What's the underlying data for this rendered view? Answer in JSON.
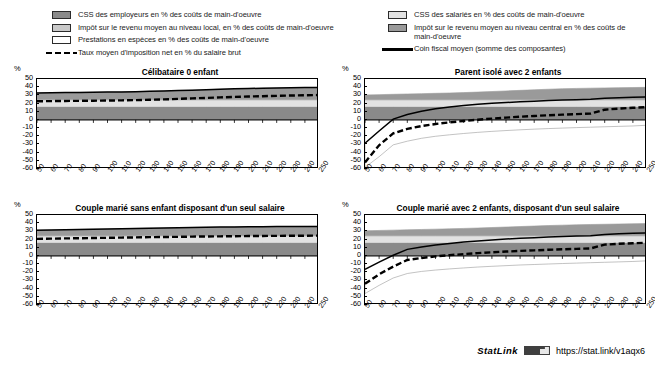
{
  "legend": {
    "left_items": [
      {
        "swatch": "employer-swatch",
        "label": "CSS des employeurs en % des coûts de main-d'oeuvre"
      },
      {
        "swatch": "local-tax-swatch",
        "label": "Impôt sur le revenu moyen au niveau local, en % des coûts de main-d'oeuvre"
      },
      {
        "swatch": "benefits-swatch",
        "label": "Prestations en espèces en % des coûts de main-d'oeuvre"
      },
      {
        "swatch": "dashed-line-sample",
        "label": "Taux moyen d'imposition net en % du salaire brut"
      }
    ],
    "right_items": [
      {
        "swatch": "employee-swatch",
        "label": "CSS des salariés en % des coûts de main-d'oeuvre"
      },
      {
        "swatch": "central-tax-swatch",
        "label": "Impôt sur le revenu moyen au niveau central en % des coûts de main-d'oeuvre"
      },
      {
        "swatch": "solid-line-sample",
        "label": "Coin fiscal moyen (somme des composantes)"
      }
    ]
  },
  "colors": {
    "employer": "#8a8a8a",
    "local_tax": "#c9c9c9",
    "benefits": "#ffffff",
    "employee": "#e2e2e2",
    "central_tax": "#9a9a9a",
    "net_rate_line": "#000000",
    "wedge_line": "#000000",
    "axis": "#000000"
  },
  "statlink": {
    "word": "StatLink",
    "badge": "statlink-badge-icon",
    "url": "https://stat.link/v1aqx6"
  },
  "axes": {
    "unit": "%",
    "y_ticks": [
      50,
      40,
      30,
      20,
      10,
      0,
      -10,
      -20,
      -30,
      -40,
      -50,
      -60
    ],
    "ylim": [
      -60,
      50
    ],
    "x_ticks": [
      50,
      60,
      70,
      80,
      90,
      100,
      110,
      120,
      130,
      140,
      150,
      160,
      170,
      180,
      190,
      200,
      210,
      220,
      230,
      240,
      250
    ],
    "xlim": [
      50,
      250
    ]
  },
  "chart_data": [
    {
      "id": "celibataire-0-enfant",
      "type": "area",
      "title": "Célibataire 0 enfant",
      "xlabel": "",
      "ylabel": "%",
      "ylim": [
        -60,
        50
      ],
      "xlim": [
        50,
        250
      ],
      "grid": false,
      "legend_position": "top",
      "x": [
        50,
        60,
        70,
        80,
        90,
        100,
        110,
        120,
        130,
        140,
        150,
        160,
        170,
        180,
        190,
        200,
        210,
        220,
        230,
        240,
        250
      ],
      "series": [
        {
          "name": "CSS des employeurs en % des coûts de main-d'oeuvre",
          "stack": true,
          "color": "#8a8a8a",
          "values": [
            16.3,
            16.3,
            16.3,
            16.3,
            16.3,
            16.3,
            16.3,
            16.3,
            16.3,
            16.3,
            16.3,
            16.3,
            16.3,
            16.3,
            16.3,
            16.3,
            16.3,
            16.3,
            16.3,
            16.3,
            16.3
          ]
        },
        {
          "name": "CSS des salariés en % des coûts de main-d'oeuvre",
          "stack": true,
          "color": "#e2e2e2",
          "values": [
            8.2,
            8.2,
            8.2,
            8.2,
            8.2,
            8.2,
            8.2,
            8.2,
            8.2,
            8.2,
            8.2,
            8.2,
            8.2,
            8.2,
            8.2,
            8.2,
            8.2,
            8.2,
            8.2,
            8.2,
            8.2
          ]
        },
        {
          "name": "Impôt sur le revenu moyen au niveau central en % des coûts de main-d'oeuvre",
          "stack": true,
          "color": "#9a9a9a",
          "values": [
            8.5,
            8.7,
            8.9,
            9.1,
            9.3,
            9.5,
            9.7,
            10.0,
            10.4,
            10.9,
            11.4,
            11.9,
            12.4,
            13.0,
            13.5,
            13.9,
            14.2,
            14.5,
            14.8,
            15.0,
            15.2
          ]
        },
        {
          "name": "Impôt sur le revenu moyen au niveau local, en % des coûts de main-d'oeuvre",
          "stack": true,
          "color": "#c9c9c9",
          "values": [
            0,
            0,
            0,
            0,
            0,
            0,
            0,
            0,
            0,
            0,
            0,
            0,
            0,
            0,
            0,
            0,
            0,
            0,
            0,
            0,
            0
          ]
        },
        {
          "name": "Prestations en espèces en % des coûts de main-d'oeuvre",
          "stack": true,
          "color": "#ffffff",
          "values": [
            0,
            0,
            0,
            0,
            0,
            0,
            0,
            0,
            0,
            0,
            0,
            0,
            0,
            0,
            0,
            0,
            0,
            0,
            0,
            0,
            0
          ]
        }
      ],
      "lines": [
        {
          "name": "Coin fiscal moyen (somme des composantes)",
          "style": "solid",
          "color": "#000000",
          "values": [
            33.0,
            33.2,
            33.4,
            33.6,
            33.8,
            34.0,
            34.2,
            34.5,
            34.9,
            35.4,
            35.9,
            36.4,
            36.9,
            37.5,
            38.0,
            38.4,
            38.7,
            39.0,
            39.3,
            39.5,
            39.7
          ]
        },
        {
          "name": "Taux moyen d'imposition net en % du salaire brut",
          "style": "dashed",
          "color": "#000000",
          "values": [
            22.8,
            23.0,
            23.2,
            23.3,
            23.5,
            23.7,
            23.9,
            24.2,
            24.6,
            25.1,
            25.7,
            26.3,
            26.9,
            27.5,
            28.1,
            28.6,
            29.0,
            29.4,
            29.8,
            30.1,
            30.4
          ]
        }
      ]
    },
    {
      "id": "parent-isole-2-enfants",
      "type": "area",
      "title": "Parent isolé avec 2 enfants",
      "xlabel": "",
      "ylabel": "%",
      "ylim": [
        -60,
        50
      ],
      "xlim": [
        50,
        250
      ],
      "grid": false,
      "legend_position": "top",
      "x": [
        50,
        60,
        70,
        80,
        90,
        100,
        110,
        120,
        130,
        140,
        150,
        160,
        170,
        180,
        190,
        200,
        210,
        220,
        230,
        240,
        250
      ],
      "series": [
        {
          "name": "CSS des employeurs en % des coûts de main-d'oeuvre",
          "stack": true,
          "color": "#8a8a8a",
          "values": [
            16.3,
            16.3,
            16.3,
            16.3,
            16.3,
            16.3,
            16.3,
            16.3,
            16.3,
            16.3,
            16.3,
            16.3,
            16.3,
            16.3,
            16.3,
            16.3,
            16.3,
            16.3,
            16.3,
            16.3,
            16.3
          ]
        },
        {
          "name": "CSS des salariés en % des coûts de main-d'oeuvre",
          "stack": true,
          "color": "#e2e2e2",
          "values": [
            8.2,
            8.2,
            8.2,
            8.2,
            8.2,
            8.2,
            8.2,
            8.2,
            8.2,
            8.2,
            8.2,
            8.2,
            8.2,
            8.2,
            8.2,
            8.2,
            8.2,
            8.2,
            8.2,
            8.2,
            8.2
          ]
        },
        {
          "name": "Impôt sur le revenu moyen au niveau central en % des coûts de main-d'oeuvre",
          "stack": true,
          "color": "#9a9a9a",
          "values": [
            6.0,
            6.4,
            6.8,
            7.2,
            7.6,
            8.0,
            8.4,
            8.9,
            9.5,
            10.2,
            10.9,
            11.6,
            12.3,
            13.0,
            13.6,
            14.0,
            14.3,
            14.6,
            14.9,
            15.1,
            15.3
          ]
        },
        {
          "name": "Impôt sur le revenu moyen au niveau local, en % des coûts de main-d'oeuvre",
          "stack": true,
          "color": "#c9c9c9",
          "values": [
            0,
            0,
            0,
            0,
            0,
            0,
            0,
            0,
            0,
            0,
            0,
            0,
            0,
            0,
            0,
            0,
            0,
            0,
            0,
            0,
            0
          ]
        },
        {
          "name": "Prestations en espèces en % des coûts de main-d'oeuvre",
          "stack": true,
          "color": "#ffffff",
          "values": [
            -58.0,
            -45.0,
            -30.5,
            -26.0,
            -22.5,
            -20.0,
            -18.2,
            -16.6,
            -15.2,
            -14.0,
            -13.0,
            -12.1,
            -11.3,
            -10.6,
            -10.0,
            -9.4,
            -8.9,
            -8.4,
            -7.9,
            -7.4,
            -6.5
          ]
        }
      ],
      "lines": [
        {
          "name": "Coin fiscal moyen (somme des composantes)",
          "style": "solid",
          "color": "#000000",
          "values": [
            -28.5,
            -13.5,
            1.0,
            6.5,
            10.5,
            13.5,
            15.8,
            17.6,
            19.1,
            20.3,
            21.3,
            22.2,
            22.9,
            23.6,
            24.2,
            24.7,
            25.2,
            26.5,
            27.1,
            27.7,
            28.2
          ]
        },
        {
          "name": "Taux moyen d'imposition net en % du salaire brut",
          "style": "dashed",
          "color": "#000000",
          "values": [
            -52.0,
            -31.0,
            -16.5,
            -11.0,
            -7.5,
            -5.0,
            -3.0,
            -1.3,
            0.2,
            1.6,
            2.8,
            3.9,
            4.8,
            5.7,
            6.4,
            7.1,
            7.7,
            12.5,
            13.8,
            14.8,
            15.6
          ]
        }
      ]
    },
    {
      "id": "couple-marie-sans-enfant",
      "type": "area",
      "title": "Couple marié sans enfant disposant d'un seul salaire",
      "xlabel": "",
      "ylabel": "%",
      "ylim": [
        -60,
        50
      ],
      "xlim": [
        50,
        250
      ],
      "grid": false,
      "legend_position": "top",
      "x": [
        50,
        60,
        70,
        80,
        90,
        100,
        110,
        120,
        130,
        140,
        150,
        160,
        170,
        180,
        190,
        200,
        210,
        220,
        230,
        240,
        250
      ],
      "series": [
        {
          "name": "CSS des employeurs en % des coûts de main-d'oeuvre",
          "stack": true,
          "color": "#8a8a8a",
          "values": [
            16.3,
            16.3,
            16.3,
            16.3,
            16.3,
            16.3,
            16.3,
            16.3,
            16.3,
            16.3,
            16.3,
            16.3,
            16.3,
            16.3,
            16.3,
            16.3,
            16.3,
            16.3,
            16.3,
            16.3,
            16.3
          ]
        },
        {
          "name": "CSS des salariés en % des coûts de main-d'oeuvre",
          "stack": true,
          "color": "#e2e2e2",
          "values": [
            8.2,
            8.2,
            8.2,
            8.2,
            8.2,
            8.2,
            8.2,
            8.2,
            8.2,
            8.2,
            8.2,
            8.2,
            8.2,
            8.2,
            8.2,
            8.2,
            8.2,
            8.2,
            8.2,
            8.2,
            8.2
          ]
        },
        {
          "name": "Impôt sur le revenu moyen au niveau central en % des coûts de main-d'oeuvre",
          "stack": true,
          "color": "#9a9a9a",
          "values": [
            7.0,
            7.3,
            7.6,
            7.9,
            8.2,
            8.5,
            8.8,
            9.1,
            9.4,
            9.7,
            10.0,
            10.3,
            10.5,
            10.7,
            10.9,
            11.1,
            11.2,
            11.3,
            11.4,
            11.5,
            11.6
          ]
        },
        {
          "name": "Impôt sur le revenu moyen au niveau local, en % des coûts de main-d'oeuvre",
          "stack": true,
          "color": "#c9c9c9",
          "values": [
            0,
            0,
            0,
            0,
            0,
            0,
            0,
            0,
            0,
            0,
            0,
            0,
            0,
            0,
            0,
            0,
            0,
            0,
            0,
            0,
            0
          ]
        },
        {
          "name": "Prestations en espèces en % des coûts de main-d'oeuvre",
          "stack": true,
          "color": "#ffffff",
          "values": [
            0,
            0,
            0,
            0,
            0,
            0,
            0,
            0,
            0,
            0,
            0,
            0,
            0,
            0,
            0,
            0,
            0,
            0,
            0,
            0,
            0
          ]
        }
      ],
      "lines": [
        {
          "name": "Coin fiscal moyen (somme des composantes)",
          "style": "solid",
          "color": "#000000",
          "values": [
            31.5,
            31.8,
            32.1,
            32.4,
            32.7,
            33.0,
            33.3,
            33.6,
            33.9,
            34.2,
            34.5,
            34.8,
            35.0,
            35.2,
            35.4,
            35.6,
            35.7,
            35.8,
            35.9,
            36.0,
            36.1
          ]
        },
        {
          "name": "Taux moyen d'imposition net en % du salaire brut",
          "style": "dashed",
          "color": "#000000",
          "values": [
            20.8,
            21.1,
            21.4,
            21.6,
            21.9,
            22.1,
            22.4,
            22.6,
            22.9,
            23.1,
            23.3,
            23.6,
            23.8,
            23.9,
            24.1,
            24.3,
            24.4,
            24.5,
            24.6,
            24.7,
            24.8
          ]
        }
      ]
    },
    {
      "id": "couple-marie-2-enfants",
      "type": "area",
      "title": "Couple marié avec 2 enfants, disposant d'un seul salaire",
      "xlabel": "",
      "ylabel": "%",
      "ylim": [
        -60,
        50
      ],
      "xlim": [
        50,
        250
      ],
      "grid": false,
      "legend_position": "top",
      "x": [
        50,
        60,
        70,
        80,
        90,
        100,
        110,
        120,
        130,
        140,
        150,
        160,
        170,
        180,
        190,
        200,
        210,
        220,
        230,
        240,
        250
      ],
      "series": [
        {
          "name": "CSS des employeurs en % des coûts de main-d'oeuvre",
          "stack": true,
          "color": "#8a8a8a",
          "values": [
            16.3,
            16.3,
            16.3,
            16.3,
            16.3,
            16.3,
            16.3,
            16.3,
            16.3,
            16.3,
            16.3,
            16.3,
            16.3,
            16.3,
            16.3,
            16.3,
            16.3,
            16.3,
            16.3,
            16.3,
            16.3
          ]
        },
        {
          "name": "CSS des salariés en % des coûts de main-d'oeuvre",
          "stack": true,
          "color": "#e2e2e2",
          "values": [
            8.2,
            8.2,
            8.2,
            8.2,
            8.2,
            8.2,
            8.2,
            8.2,
            8.2,
            8.2,
            8.2,
            8.2,
            8.2,
            8.2,
            8.2,
            8.2,
            8.2,
            8.2,
            8.2,
            8.2,
            8.2
          ]
        },
        {
          "name": "Impôt sur le revenu moyen au niveau central en % des coûts de main-d'oeuvre",
          "stack": true,
          "color": "#9a9a9a",
          "values": [
            6.2,
            6.6,
            7.0,
            7.4,
            7.8,
            8.2,
            8.6,
            9.1,
            9.6,
            10.2,
            10.8,
            11.4,
            12.0,
            12.6,
            13.1,
            13.5,
            13.9,
            14.2,
            14.5,
            14.8,
            15.0
          ]
        },
        {
          "name": "Impôt sur le revenu moyen au niveau local, en % des coûts de main-d'oeuvre",
          "stack": true,
          "color": "#c9c9c9",
          "values": [
            0,
            0,
            0,
            0,
            0,
            0,
            0,
            0,
            0,
            0,
            0,
            0,
            0,
            0,
            0,
            0,
            0,
            0,
            0,
            0,
            0
          ]
        },
        {
          "name": "Prestations en espèces en % des coûts de main-d'oeuvre",
          "stack": true,
          "color": "#ffffff",
          "values": [
            -46.0,
            -36.0,
            -27.0,
            -21.5,
            -19.0,
            -17.3,
            -15.9,
            -14.7,
            -13.6,
            -12.7,
            -11.9,
            -11.1,
            -10.5,
            -9.9,
            -9.3,
            -8.8,
            -8.3,
            -7.8,
            -7.3,
            -6.8,
            -6.0
          ]
        }
      ],
      "lines": [
        {
          "name": "Coin fiscal moyen (somme des composantes)",
          "style": "solid",
          "color": "#000000",
          "values": [
            -16.5,
            -7.5,
            0.8,
            8.0,
            11.0,
            13.4,
            15.3,
            16.9,
            18.3,
            19.5,
            20.6,
            21.5,
            22.3,
            23.0,
            23.6,
            24.2,
            24.7,
            26.3,
            27.0,
            27.6,
            28.1
          ]
        },
        {
          "name": "Taux moyen d'imposition net en % du salaire brut",
          "style": "dashed",
          "color": "#000000",
          "values": [
            -34.0,
            -22.5,
            -13.0,
            -5.0,
            -2.5,
            -0.6,
            0.9,
            2.2,
            3.4,
            4.4,
            5.3,
            6.1,
            6.8,
            7.5,
            8.1,
            8.6,
            9.1,
            13.8,
            14.8,
            15.5,
            16.1
          ]
        }
      ]
    }
  ]
}
